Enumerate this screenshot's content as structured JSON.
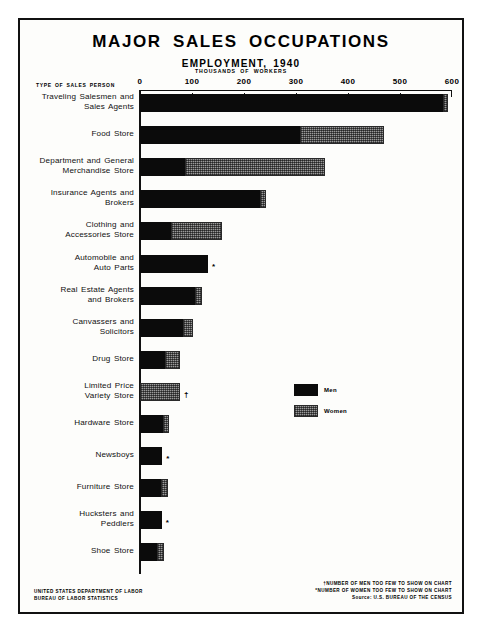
{
  "poster": {
    "title": "MAJOR SALES OCCUPATIONS",
    "subtitle": "EMPLOYMENT, 1940",
    "category_axis_header": "TYPE OF SALES PERSON",
    "value_axis_caption": "THOUSANDS OF WORKERS",
    "agency_line1": "UNITED STATES DEPARTMENT OF LABOR",
    "agency_line2": "BUREAU OF LABOR STATISTICS",
    "footnote_dagger": "†NUMBER OF MEN TOO FEW TO SHOW ON CHART",
    "footnote_asterisk": "*NUMBER OF WOMEN TOO FEW TO SHOW ON CHART",
    "source": "Source: U.S. BUREAU OF THE CENSUS"
  },
  "colors": {
    "men": "#0b0b0b",
    "women": "#9a9a9a",
    "frame": "#111111",
    "paper": "#fdfdfb"
  },
  "legend": {
    "items": [
      {
        "label": "Men",
        "key": "men"
      },
      {
        "label": "Women",
        "key": "women"
      }
    ]
  },
  "chart_data": {
    "type": "bar",
    "orientation": "horizontal",
    "stacked": true,
    "title": "MAJOR SALES OCCUPATIONS",
    "subtitle": "EMPLOYMENT, 1940",
    "xlabel": "THOUSANDS OF WORKERS",
    "ylabel": "TYPE OF SALES PERSON",
    "xlim": [
      0,
      600
    ],
    "xticks": [
      0,
      100,
      200,
      300,
      400,
      500,
      600
    ],
    "xtick_labels": [
      "0",
      "100",
      "200",
      "300",
      "400",
      "500",
      "600"
    ],
    "grid": false,
    "legend_position": "center-right",
    "series": [
      {
        "name": "Men",
        "values": [
          583,
          308,
          87,
          231,
          60,
          131,
          106,
          83,
          48,
          0,
          45,
          43,
          40,
          42,
          33
        ]
      },
      {
        "name": "Women",
        "values": [
          10,
          162,
          268,
          12,
          97,
          0,
          13,
          18,
          29,
          77,
          10,
          0,
          13,
          0,
          14
        ]
      }
    ],
    "categories": [
      "Traveling Salesmen and Sales Agents",
      "Food Store",
      "Department and General Merchandise Store",
      "Insurance Agents and Brokers",
      "Clothing and Accessories Store",
      "Automobile and Auto Parts",
      "Real Estate Agents and Brokers",
      "Canvassers and Solicitors",
      "Drug Store",
      "Limited Price Variety Store",
      "Hardware Store",
      "Newsboys",
      "Furniture Store",
      "Hucksters and Peddlers",
      "Shoe Store"
    ],
    "rows": [
      {
        "label_lines": [
          "Traveling Salesmen and",
          "Sales Agents"
        ],
        "men": 583,
        "women": 10,
        "note": ""
      },
      {
        "label_lines": [
          "Food Store"
        ],
        "men": 308,
        "women": 162,
        "note": ""
      },
      {
        "label_lines": [
          "Department and General",
          "Merchandise Store"
        ],
        "men": 87,
        "women": 268,
        "note": ""
      },
      {
        "label_lines": [
          "Insurance Agents and",
          "Brokers"
        ],
        "men": 231,
        "women": 12,
        "note": ""
      },
      {
        "label_lines": [
          "Clothing and",
          "Accessories Store"
        ],
        "men": 60,
        "women": 97,
        "note": ""
      },
      {
        "label_lines": [
          "Automobile and",
          "Auto Parts"
        ],
        "men": 131,
        "women": 0,
        "note": "*"
      },
      {
        "label_lines": [
          "Real Estate Agents",
          "and Brokers"
        ],
        "men": 106,
        "women": 13,
        "note": ""
      },
      {
        "label_lines": [
          "Canvassers and",
          "Solicitors"
        ],
        "men": 83,
        "women": 18,
        "note": ""
      },
      {
        "label_lines": [
          "Drug Store"
        ],
        "men": 48,
        "women": 29,
        "note": ""
      },
      {
        "label_lines": [
          "Limited Price",
          "Variety Store"
        ],
        "men": 0,
        "women": 77,
        "note": "†"
      },
      {
        "label_lines": [
          "Hardware Store"
        ],
        "men": 45,
        "women": 10,
        "note": ""
      },
      {
        "label_lines": [
          "Newsboys"
        ],
        "men": 43,
        "women": 0,
        "note": "*"
      },
      {
        "label_lines": [
          "Furniture Store"
        ],
        "men": 40,
        "women": 13,
        "note": ""
      },
      {
        "label_lines": [
          "Hucksters and",
          "Peddlers"
        ],
        "men": 42,
        "women": 0,
        "note": "*"
      },
      {
        "label_lines": [
          "Shoe Store"
        ],
        "men": 33,
        "women": 14,
        "note": ""
      }
    ]
  }
}
